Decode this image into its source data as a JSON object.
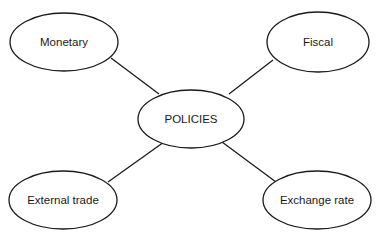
{
  "diagram": {
    "type": "mind-map",
    "center": {
      "id": "policies",
      "label": "POLICIES",
      "shape": "ellipse",
      "cx": 191,
      "cy": 119,
      "rx": 53,
      "ry": 29
    },
    "nodes": [
      {
        "id": "monetary",
        "label": "Monetary",
        "shape": "ellipse",
        "cx": 64,
        "cy": 42,
        "rx": 54,
        "ry": 29
      },
      {
        "id": "fiscal",
        "label": "Fiscal",
        "shape": "ellipse",
        "cx": 318,
        "cy": 42,
        "rx": 51,
        "ry": 30
      },
      {
        "id": "external-trade",
        "label": "External trade",
        "shape": "ellipse",
        "cx": 63,
        "cy": 200,
        "rx": 54,
        "ry": 29
      },
      {
        "id": "exchange-rate",
        "label": "Exchange rate",
        "shape": "ellipse",
        "cx": 317,
        "cy": 200,
        "rx": 54,
        "ry": 29
      }
    ],
    "edges": [
      {
        "from": "monetary",
        "to": "policies",
        "x1": 111,
        "y1": 58,
        "x2": 159,
        "y2": 94
      },
      {
        "from": "fiscal",
        "to": "policies",
        "x1": 273,
        "y1": 60,
        "x2": 229,
        "y2": 94
      },
      {
        "from": "policies",
        "to": "external-trade",
        "x1": 164,
        "y1": 142,
        "x2": 108,
        "y2": 182
      },
      {
        "from": "policies",
        "to": "exchange-rate",
        "x1": 222,
        "y1": 142,
        "x2": 276,
        "y2": 182
      }
    ],
    "colors": {
      "stroke": "#1a1a1a",
      "fill": "#ffffff",
      "text": "#1a1a1a"
    }
  }
}
